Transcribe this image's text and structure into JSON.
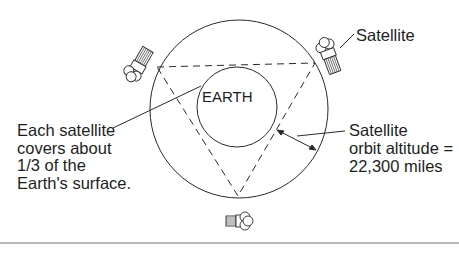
{
  "diagram": {
    "earth_label": "EARTH",
    "satellite_label": "Satellite",
    "coverage_note": [
      "Each satellite",
      "covers about",
      "1/3 of the",
      "Earth's surface."
    ],
    "altitude_note": [
      "Satellite",
      "orbit altitude =",
      "22,300 miles"
    ],
    "colors": {
      "line": "#2a2a2a",
      "background": "#ffffff",
      "rule": "#b8b8b8"
    },
    "icons": [
      "satellite-icon",
      "satellite-icon",
      "satellite-icon"
    ]
  }
}
